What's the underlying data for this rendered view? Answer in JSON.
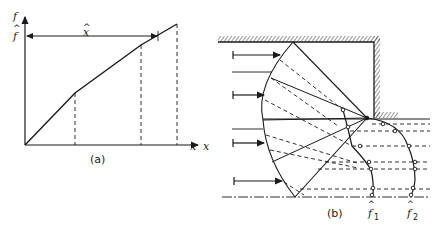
{
  "figure": {
    "panel_a": {
      "caption": "(a)",
      "y_axis_label": "f",
      "x_axis_label": "x",
      "fhat_label": "f",
      "fhat_hat": "^",
      "xhat_label": "x",
      "xhat_hat": "^",
      "line_points": [
        [
          0,
          0
        ],
        [
          50,
          52
        ],
        [
          116,
          100
        ],
        [
          152,
          121
        ]
      ],
      "dashed_verticals_at": [
        50,
        116,
        152
      ],
      "colors": {
        "ink": "#1a1a1a",
        "background": "#ffffff"
      }
    },
    "panel_b": {
      "caption": "(b)",
      "x_label": "x",
      "f1_label": "f",
      "f1_sub": "1",
      "f2_label": "f",
      "f2_sub": "2",
      "hat": "^",
      "incoming_arrows": 4,
      "colors": {
        "ink": "#1a1a1a",
        "background": "#ffffff"
      }
    }
  }
}
